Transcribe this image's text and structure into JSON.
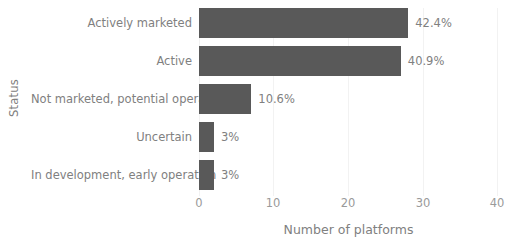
{
  "chart_data": {
    "type": "bar",
    "orientation": "horizontal",
    "title": "",
    "xlabel": "Number of platforms",
    "ylabel": "Status",
    "categories": [
      "Actively marketed",
      "Active",
      "Not marketed, potential operation",
      "Uncertain",
      "In development, early operation"
    ],
    "values": [
      28,
      27,
      7,
      2,
      2
    ],
    "data_labels": [
      "42.4%",
      "40.9%",
      "10.6%",
      "3%",
      "3%"
    ],
    "xlim": [
      0,
      40
    ],
    "xticks": [
      "0",
      "10",
      "20",
      "30",
      "40"
    ],
    "xtick_values": [
      0,
      10,
      20,
      30,
      40
    ],
    "grid": "vertical",
    "legend": "none",
    "bar_color": "#595959",
    "text_color": "#808080",
    "gridline_color": "#f2f2f2",
    "background_color": "#ffffff"
  }
}
